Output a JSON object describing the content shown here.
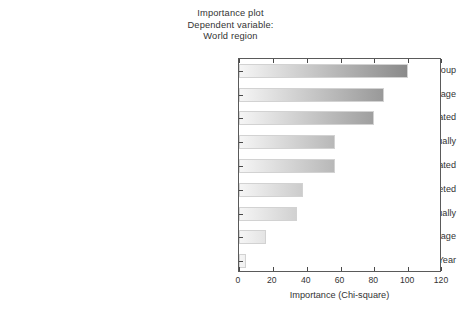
{
  "title": {
    "line1": "Importance plot",
    "line2": "Dependent variable:",
    "line3": "World region"
  },
  "axes": {
    "xlabel": "Importance (Chi-square)",
    "xticks": [
      "0",
      "20",
      "40",
      "60",
      "80",
      "100",
      "120"
    ]
  },
  "colors": {
    "bar_light": "#f5f5f5",
    "bar_dark": "#8a8a8a",
    "frame": "#5a5a5a",
    "text": "#333333"
  },
  "chart_data": {
    "type": "bar",
    "orientation": "horizontal",
    "title": "Importance plot\nDependent variable:\nWorld region",
    "xlabel": "Importance (Chi-square)",
    "ylabel": "",
    "xlim": [
      0,
      120
    ],
    "xticks": [
      0,
      20,
      40,
      60,
      80,
      100,
      120
    ],
    "grid": false,
    "legend": null,
    "categories": [
      "Age group",
      "National coverage",
      "Reported number of people treated",
      "SAC population requiring PC for SCH annually",
      "Reported number of SAC treated",
      "Number of people targeted",
      "Population requiring PC for SCH annually",
      "Programme coverage",
      "Year"
    ],
    "values": [
      100,
      86,
      80,
      57,
      57,
      38,
      34,
      16,
      4
    ]
  }
}
